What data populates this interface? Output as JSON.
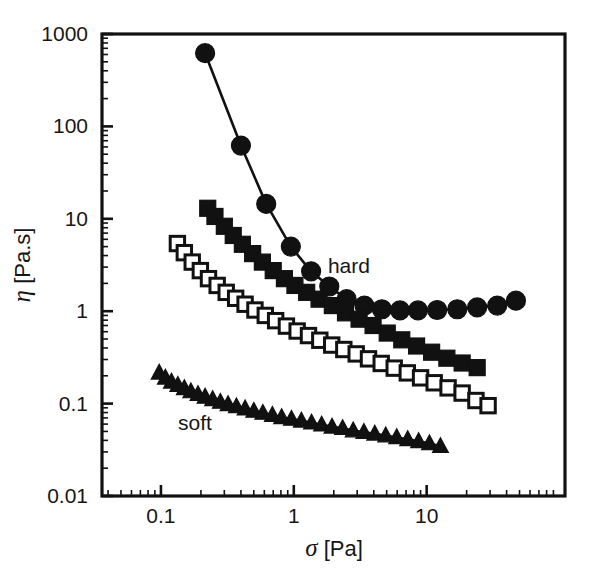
{
  "figure": {
    "background": "#ffffff",
    "ink": "#111111"
  },
  "chart_data": {
    "type": "scatter",
    "title": "",
    "subtitle": "",
    "xlabel": "σ [Pa]",
    "ylabel": "η [Pa.s]",
    "xscale": "log",
    "yscale": "log",
    "xlim": [
      0.036,
      110
    ],
    "ylim": [
      0.01,
      1000
    ],
    "grid": false,
    "legend_position": "inline-annotations",
    "xticks": [
      0.1,
      1,
      10
    ],
    "xtick_labels": [
      "0.1",
      "1",
      "10"
    ],
    "yticks": [
      0.01,
      0.1,
      1,
      10,
      100,
      1000
    ],
    "ytick_labels": [
      "0.01",
      "0.1",
      "1",
      "10",
      "100",
      "1000"
    ],
    "annotations": [
      {
        "text": "hard",
        "x": 2.6,
        "y": 2.6
      },
      {
        "text": "soft",
        "x": 0.18,
        "y": 0.052
      }
    ],
    "series": [
      {
        "name": "hard",
        "marker": "filled-circle",
        "connected": true,
        "points": [
          {
            "x": 0.215,
            "y": 620
          },
          {
            "x": 0.4,
            "y": 62
          },
          {
            "x": 0.62,
            "y": 14.5
          },
          {
            "x": 0.95,
            "y": 5.0
          },
          {
            "x": 1.35,
            "y": 2.7
          },
          {
            "x": 1.85,
            "y": 1.85
          },
          {
            "x": 2.5,
            "y": 1.35
          },
          {
            "x": 3.4,
            "y": 1.15
          },
          {
            "x": 4.6,
            "y": 1.05
          },
          {
            "x": 6.3,
            "y": 1.02
          },
          {
            "x": 8.6,
            "y": 1.02
          },
          {
            "x": 12.0,
            "y": 1.03
          },
          {
            "x": 17.0,
            "y": 1.05
          },
          {
            "x": 24.0,
            "y": 1.1
          },
          {
            "x": 34.0,
            "y": 1.15
          },
          {
            "x": 47.0,
            "y": 1.3
          }
        ]
      },
      {
        "name": "intermediate-filled-squares",
        "marker": "filled-square",
        "connected": true,
        "points": [
          {
            "x": 0.225,
            "y": 13.0
          },
          {
            "x": 0.255,
            "y": 10.6
          },
          {
            "x": 0.3,
            "y": 8.3
          },
          {
            "x": 0.35,
            "y": 6.6
          },
          {
            "x": 0.41,
            "y": 5.3
          },
          {
            "x": 0.49,
            "y": 4.2
          },
          {
            "x": 0.58,
            "y": 3.4
          },
          {
            "x": 0.7,
            "y": 2.75
          },
          {
            "x": 0.85,
            "y": 2.25
          },
          {
            "x": 1.02,
            "y": 1.9
          },
          {
            "x": 1.25,
            "y": 1.6
          },
          {
            "x": 1.55,
            "y": 1.35
          },
          {
            "x": 1.95,
            "y": 1.15
          },
          {
            "x": 2.45,
            "y": 0.96
          },
          {
            "x": 3.1,
            "y": 0.82
          },
          {
            "x": 3.95,
            "y": 0.7
          },
          {
            "x": 5.05,
            "y": 0.58
          },
          {
            "x": 6.5,
            "y": 0.49
          },
          {
            "x": 8.4,
            "y": 0.42
          },
          {
            "x": 10.9,
            "y": 0.36
          },
          {
            "x": 14.2,
            "y": 0.31
          },
          {
            "x": 18.5,
            "y": 0.275
          },
          {
            "x": 24.0,
            "y": 0.245
          }
        ]
      },
      {
        "name": "intermediate-open-squares",
        "marker": "open-square",
        "connected": true,
        "points": [
          {
            "x": 0.133,
            "y": 5.4
          },
          {
            "x": 0.15,
            "y": 4.3
          },
          {
            "x": 0.172,
            "y": 3.4
          },
          {
            "x": 0.198,
            "y": 2.75
          },
          {
            "x": 0.228,
            "y": 2.25
          },
          {
            "x": 0.265,
            "y": 1.9
          },
          {
            "x": 0.31,
            "y": 1.6
          },
          {
            "x": 0.365,
            "y": 1.38
          },
          {
            "x": 0.43,
            "y": 1.19
          },
          {
            "x": 0.51,
            "y": 1.03
          },
          {
            "x": 0.61,
            "y": 0.9
          },
          {
            "x": 0.73,
            "y": 0.79
          },
          {
            "x": 0.88,
            "y": 0.69
          },
          {
            "x": 1.06,
            "y": 0.61
          },
          {
            "x": 1.29,
            "y": 0.545
          },
          {
            "x": 1.57,
            "y": 0.485
          },
          {
            "x": 1.93,
            "y": 0.43
          },
          {
            "x": 2.38,
            "y": 0.385
          },
          {
            "x": 2.95,
            "y": 0.345
          },
          {
            "x": 3.65,
            "y": 0.305
          },
          {
            "x": 4.55,
            "y": 0.272
          },
          {
            "x": 5.7,
            "y": 0.242
          },
          {
            "x": 7.15,
            "y": 0.215
          },
          {
            "x": 9.0,
            "y": 0.19
          },
          {
            "x": 11.4,
            "y": 0.168
          },
          {
            "x": 14.5,
            "y": 0.148
          },
          {
            "x": 18.5,
            "y": 0.13
          },
          {
            "x": 23.5,
            "y": 0.108
          },
          {
            "x": 29.0,
            "y": 0.095
          }
        ]
      },
      {
        "name": "soft",
        "marker": "filled-triangle",
        "connected": true,
        "points": [
          {
            "x": 0.097,
            "y": 0.215
          },
          {
            "x": 0.108,
            "y": 0.19
          },
          {
            "x": 0.12,
            "y": 0.172
          },
          {
            "x": 0.134,
            "y": 0.158
          },
          {
            "x": 0.15,
            "y": 0.146
          },
          {
            "x": 0.168,
            "y": 0.135
          },
          {
            "x": 0.19,
            "y": 0.126
          },
          {
            "x": 0.215,
            "y": 0.118
          },
          {
            "x": 0.245,
            "y": 0.111
          },
          {
            "x": 0.28,
            "y": 0.104
          },
          {
            "x": 0.32,
            "y": 0.098
          },
          {
            "x": 0.37,
            "y": 0.093
          },
          {
            "x": 0.43,
            "y": 0.088
          },
          {
            "x": 0.5,
            "y": 0.083
          },
          {
            "x": 0.585,
            "y": 0.079
          },
          {
            "x": 0.69,
            "y": 0.075
          },
          {
            "x": 0.81,
            "y": 0.071
          },
          {
            "x": 0.96,
            "y": 0.068
          },
          {
            "x": 1.14,
            "y": 0.065
          },
          {
            "x": 1.36,
            "y": 0.062
          },
          {
            "x": 1.62,
            "y": 0.059
          },
          {
            "x": 1.94,
            "y": 0.056
          },
          {
            "x": 2.33,
            "y": 0.054
          },
          {
            "x": 2.8,
            "y": 0.051
          },
          {
            "x": 3.37,
            "y": 0.049
          },
          {
            "x": 4.07,
            "y": 0.047
          },
          {
            "x": 4.92,
            "y": 0.045
          },
          {
            "x": 5.95,
            "y": 0.043
          },
          {
            "x": 7.2,
            "y": 0.041
          },
          {
            "x": 8.7,
            "y": 0.039
          },
          {
            "x": 10.5,
            "y": 0.037
          },
          {
            "x": 12.7,
            "y": 0.0345
          }
        ]
      }
    ]
  }
}
